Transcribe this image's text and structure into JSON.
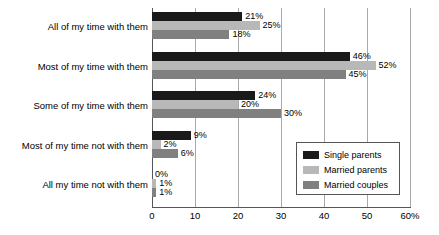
{
  "chart_data": {
    "type": "bar",
    "orientation": "horizontal",
    "title": "",
    "subtitle": "",
    "xlabel": "",
    "ylabel": "",
    "xlim": [
      0,
      60
    ],
    "grid": true,
    "legend_position": "bottom-right",
    "categories": [
      "All of my time with them",
      "Most of my time with them",
      "Some of my time with them",
      "Most of my time not with them",
      "All my time not with them"
    ],
    "series": [
      {
        "name": "Single parents",
        "color": "#1a1a1a",
        "values": [
          21,
          46,
          24,
          9,
          0
        ],
        "labels": [
          "21%",
          "46%",
          "24%",
          "9%",
          "0%"
        ]
      },
      {
        "name": "Married parents",
        "color": "#b8b8b8",
        "values": [
          25,
          52,
          20,
          2,
          1
        ],
        "labels": [
          "25%",
          "52%",
          "20%",
          "2%",
          "1%"
        ]
      },
      {
        "name": "Married couples",
        "color": "#808080",
        "values": [
          18,
          45,
          30,
          6,
          1
        ],
        "labels": [
          "18%",
          "45%",
          "30%",
          "6%",
          "1%"
        ]
      }
    ],
    "xticks": [
      0,
      10,
      20,
      30,
      40,
      50,
      60
    ],
    "xticklabels": [
      "0",
      "10",
      "20",
      "30",
      "40",
      "50",
      "60%"
    ]
  },
  "colors": {
    "axis": "#555555",
    "gridline": "#a9a9a9",
    "text": "#000000",
    "background": "#ffffff"
  }
}
